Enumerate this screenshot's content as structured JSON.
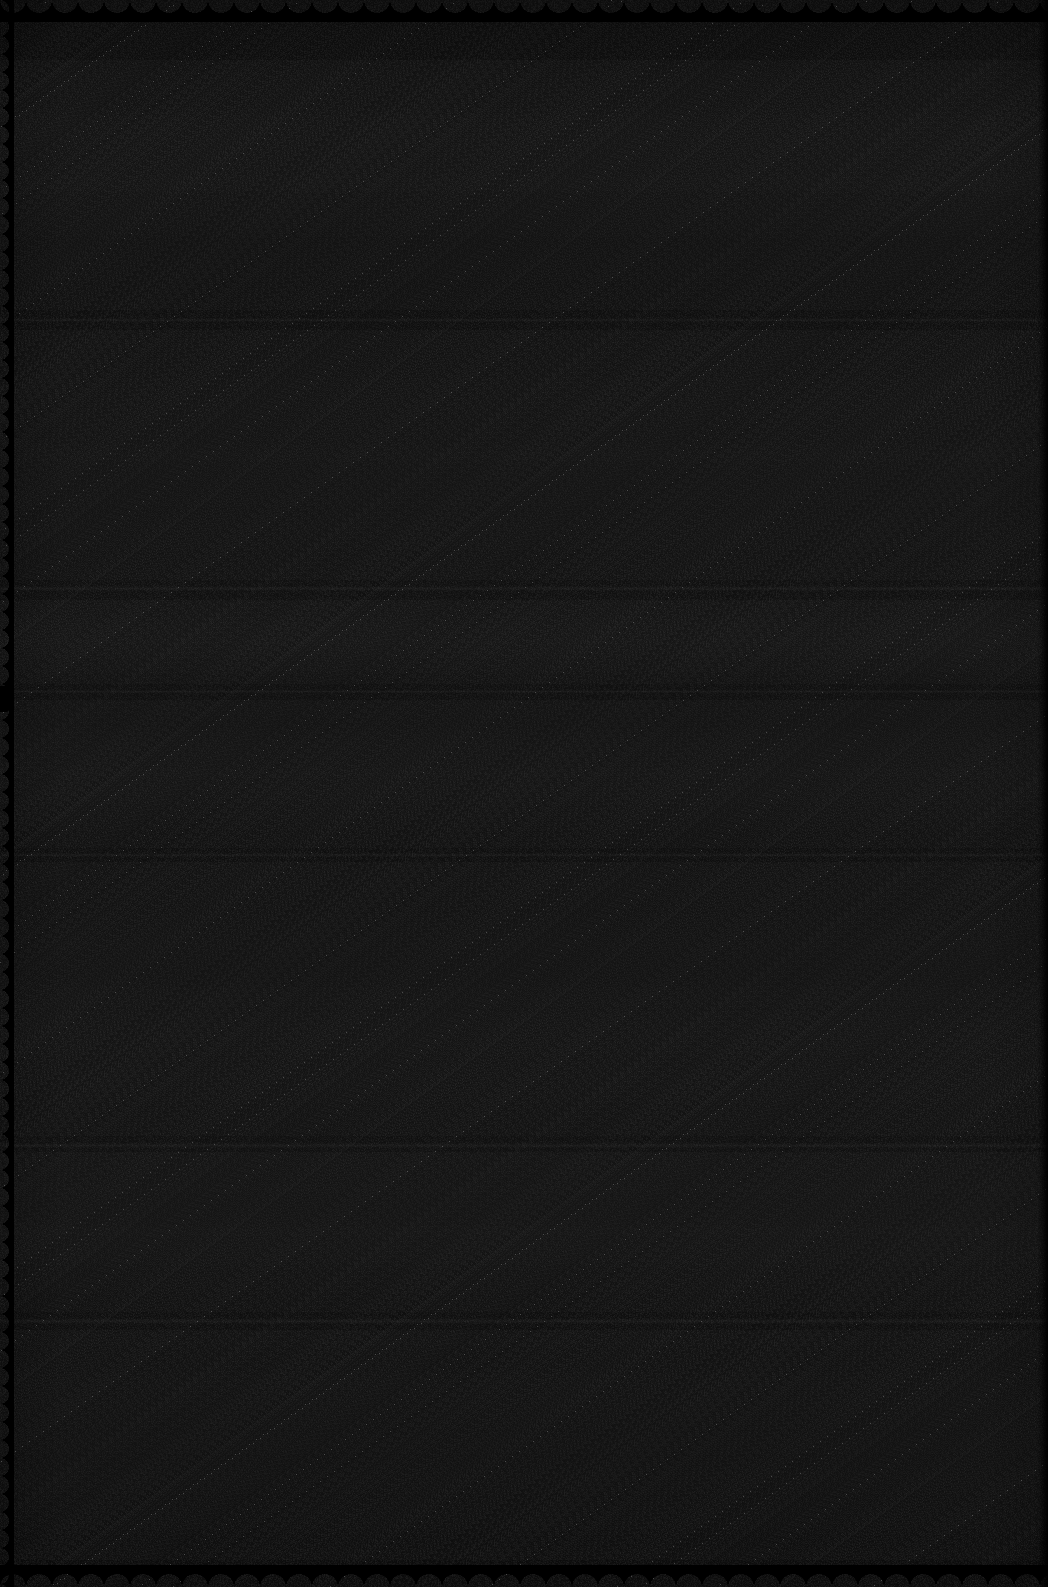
{
  "document": {
    "kind": "scanned-page",
    "legibility": "illegible",
    "visible_text": "",
    "note": "Severely underexposed photograph/scan of a page. No text, numbers, labels or icons are resolvable at any zoom level.",
    "background_color": "#080808",
    "ink_color": "#000000",
    "noise": {
      "type": "sensor-noise",
      "character": "fine-grain luminance speckle",
      "amplitude": 22
    },
    "exposure": {
      "overall": "very dark",
      "brightest_region": "center",
      "darkest_region": "corners"
    }
  },
  "page": {
    "width": 1048,
    "height": 1587,
    "edges": {
      "top": "deckled",
      "bottom": "deckled",
      "left": "deckled",
      "right": "straight"
    },
    "edge_notch": {
      "side": "left",
      "y": 686,
      "height": 26
    }
  },
  "structure": {
    "description": "Faint full-width horizontal separator bands are the only discernible structure.",
    "separators": [
      {
        "name": "separator-1",
        "y": 318,
        "height": 4,
        "style": "line"
      },
      {
        "name": "separator-2",
        "y": 586,
        "height": 5,
        "style": "line"
      },
      {
        "name": "separator-3",
        "y": 690,
        "height": 3,
        "style": "line"
      },
      {
        "name": "separator-4",
        "y": 853,
        "height": 4,
        "style": "line"
      },
      {
        "name": "separator-5",
        "y": 1143,
        "height": 5,
        "style": "line"
      },
      {
        "name": "separator-6",
        "y": 1318,
        "height": 6,
        "style": "line"
      }
    ],
    "blocks": [
      {
        "name": "block-1",
        "y": 60,
        "height": 250
      },
      {
        "name": "block-2",
        "y": 330,
        "height": 250
      },
      {
        "name": "block-3",
        "y": 600,
        "height": 84
      },
      {
        "name": "block-4",
        "y": 700,
        "height": 148
      },
      {
        "name": "block-5",
        "y": 862,
        "height": 274
      },
      {
        "name": "block-6",
        "y": 1152,
        "height": 160
      },
      {
        "name": "block-7",
        "y": 1330,
        "height": 230
      }
    ]
  }
}
